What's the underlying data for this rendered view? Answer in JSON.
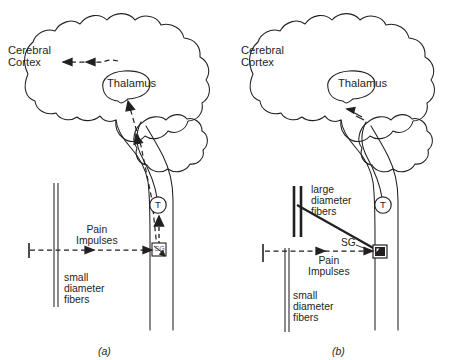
{
  "figure": {
    "panel_captions": [
      "(a)",
      "(b)"
    ],
    "ink_color": "#231f20",
    "background_color": "#ffffff"
  },
  "panel_a": {
    "caption": "(a)",
    "labels": {
      "cerebral_cortex": "Cerebral\nCortex",
      "thalamus": "Thalamus",
      "pain_impulses": "Pain\nImpulses",
      "small_diameter_fibers": "small\ndiameter\nfibers",
      "transmission_cell": "T",
      "substantia_gelatinosa": "SG"
    },
    "arrows": {
      "cortex_arrow": "dashed-double-arrow-left",
      "thalamus_arrow": "dashed-arrow-up",
      "pain_arrow": "dashed-arrow-right",
      "t_cell_arrow": "solid-arrow-up"
    }
  },
  "panel_b": {
    "caption": "(b)",
    "labels": {
      "cerebral_cortex": "Cerebral\nCortex",
      "thalamus": "Thalamus",
      "pain_impulses": "Pain\nImpulses",
      "small_diameter_fibers": "small\ndiameter\nfibers",
      "large_diameter_fibers": "large\ndiameter\nfibers",
      "transmission_cell": "T",
      "substantia_gelatinosa": "SG"
    },
    "arrows": {
      "pain_arrow": "dashed-arrow-right",
      "large_fiber_line": "solid-thick-line-to-sg"
    }
  }
}
